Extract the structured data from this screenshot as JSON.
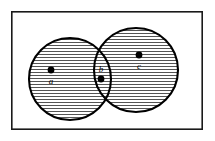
{
  "figure": {
    "kind": "venn-diagram",
    "background_color": "#ffffff",
    "frame": {
      "label": "universal-set-rectangle",
      "x": 11,
      "y": 11,
      "width": 192,
      "height": 119,
      "stroke_color": "#1a1a1a",
      "stroke_width": 1.6,
      "fill_color": "#ffffff"
    },
    "sets": [
      {
        "name": "left-set",
        "cx": 70,
        "cy": 79,
        "r": 41,
        "stroke_color": "#000000",
        "stroke_width": 2.1,
        "fill": "horizontal-hatch"
      },
      {
        "name": "right-set",
        "cx": 136,
        "cy": 70,
        "r": 42,
        "stroke_color": "#000000",
        "stroke_width": 2.1,
        "fill": "horizontal-hatch"
      }
    ],
    "hatch": {
      "orientation": "horizontal",
      "spacing": 3,
      "stroke_color": "#000000",
      "stroke_width": 0.7
    },
    "points": [
      {
        "name": "point-a",
        "label": "a",
        "dot_x": 51,
        "dot_y": 70,
        "dot_r": 3.4,
        "label_x": 51,
        "label_y": 82,
        "label_position": "below",
        "color": "#000000"
      },
      {
        "name": "point-b",
        "label": "b",
        "dot_x": 101,
        "dot_y": 78,
        "dot_r": 3.4,
        "label_x": 101,
        "label_y": 70,
        "label_position": "above",
        "color": "#000000"
      },
      {
        "name": "point-c",
        "label": "c",
        "dot_x": 139,
        "dot_y": 55,
        "dot_r": 3.4,
        "label_x": 139,
        "label_y": 67,
        "label_position": "below",
        "color": "#000000"
      }
    ]
  }
}
